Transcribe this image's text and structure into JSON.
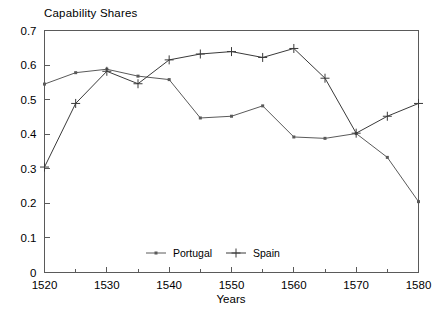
{
  "chart_data": {
    "type": "line",
    "title": "Capability Shares",
    "xlabel": "Years",
    "ylabel": "",
    "x": [
      1520,
      1525,
      1530,
      1535,
      1540,
      1545,
      1550,
      1555,
      1560,
      1565,
      1570,
      1575,
      1580
    ],
    "xlim": [
      1520,
      1580
    ],
    "ylim": [
      0,
      0.7
    ],
    "xticks": [
      1520,
      1530,
      1540,
      1550,
      1560,
      1570,
      1580
    ],
    "xtick_labels": [
      "1520",
      "1530",
      "1540",
      "1550",
      "1560",
      "1570",
      "1580"
    ],
    "xticks_minor": [
      1525,
      1535,
      1545,
      1555,
      1565,
      1575
    ],
    "yticks": [
      0,
      0.1,
      0.2,
      0.3,
      0.4,
      0.5,
      0.6,
      0.7
    ],
    "ytick_labels": [
      "0",
      "0.1",
      "0.2",
      "0.3",
      "0.4",
      "0.5",
      "0.6",
      "0.7"
    ],
    "grid": false,
    "legend_position": "inside-bottom-center",
    "series": [
      {
        "name": "Portugal",
        "marker": "dot",
        "color": "#5a5a5a",
        "values": [
          0.545,
          0.578,
          0.588,
          0.568,
          0.558,
          0.447,
          0.452,
          0.482,
          0.392,
          0.388,
          0.402,
          0.333,
          0.205
        ]
      },
      {
        "name": "Spain",
        "marker": "plus",
        "color": "#3a3a3a",
        "values": [
          0.305,
          0.489,
          0.582,
          0.546,
          0.615,
          0.632,
          0.639,
          0.622,
          0.648,
          0.562,
          0.403,
          0.452,
          0.489
        ]
      }
    ]
  },
  "legend": {
    "items": [
      {
        "label": "Portugal"
      },
      {
        "label": "Spain"
      }
    ]
  }
}
